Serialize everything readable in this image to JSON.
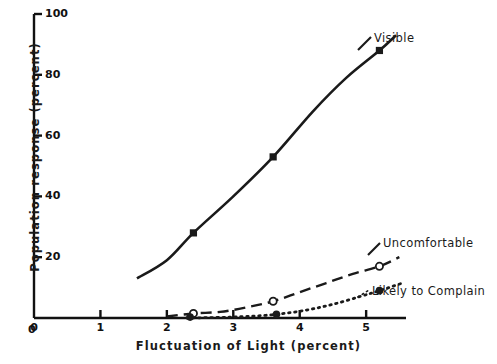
{
  "chart_data": {
    "type": "line",
    "title": "",
    "xlabel": "Fluctuation of Light (percent)",
    "ylabel": "Population response (percent)",
    "xlim": [
      0,
      5.6
    ],
    "ylim": [
      0,
      100
    ],
    "xticks": [
      "0",
      "1",
      "2",
      "3",
      "4",
      "5"
    ],
    "xtick_values": [
      0,
      1,
      2,
      3,
      4,
      5
    ],
    "yticks": [
      "0",
      "20",
      "40",
      "60",
      "80",
      "100"
    ],
    "ytick_values": [
      0,
      20,
      40,
      60,
      80,
      100
    ],
    "grid": false,
    "legend_position": "inline-right-of-curves",
    "series": [
      {
        "name": "Visible",
        "line_style": "solid",
        "marker": "filled-square",
        "color": "#1a1a1a",
        "points": [
          {
            "x": 1.55,
            "y": 13
          },
          {
            "x": 2.0,
            "y": 19
          },
          {
            "x": 2.4,
            "y": 28
          },
          {
            "x": 3.0,
            "y": 40
          },
          {
            "x": 3.6,
            "y": 53
          },
          {
            "x": 4.2,
            "y": 68
          },
          {
            "x": 4.7,
            "y": 79
          },
          {
            "x": 5.2,
            "y": 88
          },
          {
            "x": 5.45,
            "y": 93
          }
        ],
        "marker_points": [
          {
            "x": 2.4,
            "y": 28
          },
          {
            "x": 3.6,
            "y": 53
          },
          {
            "x": 5.2,
            "y": 88
          }
        ]
      },
      {
        "name": "Uncomfortable",
        "line_style": "dashed",
        "marker": "open-circle",
        "color": "#1a1a1a",
        "points": [
          {
            "x": 2.0,
            "y": 0.5
          },
          {
            "x": 2.4,
            "y": 1.5
          },
          {
            "x": 2.8,
            "y": 2.0
          },
          {
            "x": 3.2,
            "y": 3.5
          },
          {
            "x": 3.6,
            "y": 5.5
          },
          {
            "x": 4.0,
            "y": 8.5
          },
          {
            "x": 4.4,
            "y": 11.5
          },
          {
            "x": 4.8,
            "y": 14.5
          },
          {
            "x": 5.2,
            "y": 17
          },
          {
            "x": 5.5,
            "y": 20
          }
        ],
        "marker_points": [
          {
            "x": 2.4,
            "y": 1.5
          },
          {
            "x": 3.6,
            "y": 5.5
          },
          {
            "x": 5.2,
            "y": 17
          }
        ]
      },
      {
        "name": "Likely to Complain",
        "line_style": "dotted",
        "marker": "filled-circle",
        "color": "#1a1a1a",
        "points": [
          {
            "x": 2.3,
            "y": 0
          },
          {
            "x": 2.8,
            "y": 0.2
          },
          {
            "x": 3.2,
            "y": 0.5
          },
          {
            "x": 3.65,
            "y": 1.2
          },
          {
            "x": 4.1,
            "y": 2.6
          },
          {
            "x": 4.5,
            "y": 4.5
          },
          {
            "x": 4.9,
            "y": 7.0
          },
          {
            "x": 5.2,
            "y": 9.0
          },
          {
            "x": 5.55,
            "y": 11.5
          }
        ],
        "marker_points": [
          {
            "x": 2.35,
            "y": 0.3
          },
          {
            "x": 3.65,
            "y": 1.2
          },
          {
            "x": 5.2,
            "y": 9.0
          }
        ]
      }
    ],
    "annotations": [
      {
        "text": "Visible",
        "x_px": 374,
        "y_px": 39
      },
      {
        "text": "Uncomfortable",
        "x_px": 383,
        "y_px": 244
      },
      {
        "text": "Likely to Complain",
        "x_px": 372,
        "y_px": 292
      }
    ]
  },
  "axes": {
    "x_title": "Fluctuation of Light (percent)",
    "y_title": "Population response (percent)"
  },
  "series_labels": {
    "visible": "Visible",
    "uncomfortable": "Uncomfortable",
    "likely_to_complain": "Likely to Complain"
  },
  "x_tick_labels": [
    "0",
    "1",
    "2",
    "3",
    "4",
    "5"
  ],
  "y_tick_labels": [
    "0",
    "20",
    "40",
    "60",
    "80",
    "100"
  ]
}
